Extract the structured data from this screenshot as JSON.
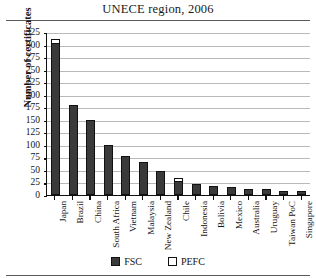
{
  "chart_data": {
    "type": "bar",
    "title": "UNECE region, 2006",
    "xlabel": "",
    "ylabel": "Number of certificates",
    "ylim": [
      0,
      325
    ],
    "ytick_step": 25,
    "yticks": [
      325,
      300,
      275,
      250,
      225,
      200,
      175,
      150,
      125,
      100,
      75,
      50,
      25,
      0
    ],
    "grid": true,
    "stacked": true,
    "legend_position": "bottom",
    "categories": [
      "Japan",
      "Brazil",
      "China",
      "South Africa",
      "Vietnam",
      "Malaysia",
      "New Zealand",
      "Chile",
      "Indonesia",
      "Bolivia",
      "Mexico",
      "Australia",
      "Uruguay",
      "Taiwan PoC",
      "Singapore"
    ],
    "series": [
      {
        "name": "FSC",
        "color": "#3a3a3a",
        "values": [
          303,
          180,
          150,
          100,
          78,
          65,
          48,
          27,
          22,
          18,
          16,
          12,
          11,
          8,
          8
        ]
      },
      {
        "name": "PEFC",
        "color": "#ffffff",
        "values": [
          9,
          0,
          0,
          0,
          0,
          0,
          0,
          7,
          0,
          0,
          0,
          0,
          0,
          0,
          0
        ]
      }
    ]
  },
  "legend": {
    "items": [
      {
        "label": "FSC",
        "swatch": "filled"
      },
      {
        "label": "PEFC",
        "swatch": "empty"
      }
    ]
  }
}
